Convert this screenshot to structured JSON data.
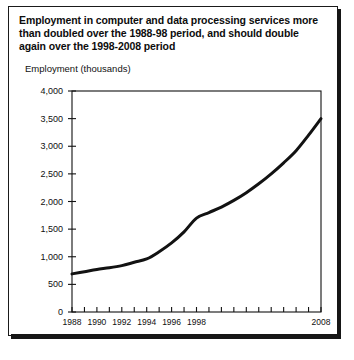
{
  "figure": {
    "title": "Employment in computer and data processing services more than doubled over the 1988-98 period, and should double again over the 1998-2008 period",
    "unit_label": "Employment (thousands)",
    "ink_color": "#121212",
    "background_color": "#ffffff"
  },
  "chart_data": {
    "type": "line",
    "title": "Employment in computer and data processing services more than doubled over the 1988-98 period, and should double again over the 1998-2008 period",
    "subtitle": "",
    "xlabel": "",
    "ylabel": "Employment (thousands)",
    "x": [
      1988,
      1989,
      1990,
      1991,
      1992,
      1993,
      1994,
      1995,
      1996,
      1997,
      1998,
      1999,
      2000,
      2001,
      2002,
      2003,
      2004,
      2005,
      2006,
      2007,
      2008
    ],
    "values": [
      690,
      730,
      770,
      800,
      840,
      900,
      960,
      1090,
      1250,
      1450,
      1700,
      1800,
      1900,
      2020,
      2160,
      2320,
      2500,
      2700,
      2920,
      3200,
      3500
    ],
    "series": [
      {
        "name": "Employment in computer and data processing services",
        "values": [
          690,
          730,
          770,
          800,
          840,
          900,
          960,
          1090,
          1250,
          1450,
          1700,
          1800,
          1900,
          2020,
          2160,
          2320,
          2500,
          2700,
          2920,
          3200,
          3500
        ]
      }
    ],
    "xlim": [
      1988,
      2008
    ],
    "ylim": [
      0,
      4000
    ],
    "ytick_values": [
      0,
      500,
      1000,
      1500,
      2000,
      2500,
      3000,
      3500,
      4000
    ],
    "ytick_labels": [
      "0",
      "500",
      "1,000",
      "1,500",
      "2,000",
      "2,500",
      "3,000",
      "3,500",
      "4,000"
    ],
    "xtick_values": [
      1988,
      1989,
      1990,
      1991,
      1992,
      1993,
      1994,
      1995,
      1996,
      1997,
      1998,
      1999,
      2000,
      2001,
      2002,
      2003,
      2004,
      2005,
      2006,
      2007,
      2008
    ],
    "xtick_labels_shown": [
      {
        "value": 1988,
        "label": "1988"
      },
      {
        "value": 1990,
        "label": "1990"
      },
      {
        "value": 1992,
        "label": "1992"
      },
      {
        "value": 1994,
        "label": "1994"
      },
      {
        "value": 1996,
        "label": "1996"
      },
      {
        "value": 1998,
        "label": "1998"
      },
      {
        "value": 2008,
        "label": "2008"
      }
    ],
    "grid": false,
    "legend": false,
    "line_color": "#121212",
    "line_width": 3
  }
}
